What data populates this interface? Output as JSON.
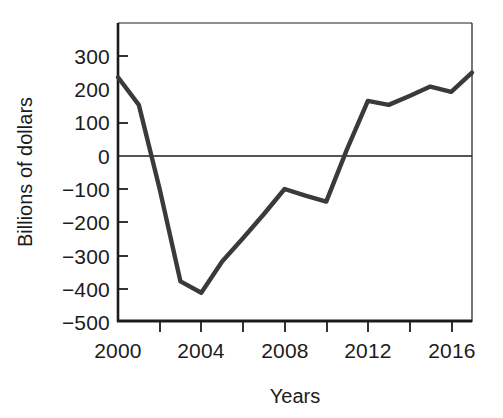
{
  "chart_data": {
    "type": "line",
    "title": "",
    "xlabel": "Years",
    "ylabel": "Billions of dollars",
    "xlim": [
      2000,
      2017
    ],
    "ylim": [
      -500,
      340
    ],
    "grid": false,
    "legend": "none",
    "zero_line": true,
    "x_ticks": [
      2000,
      2002,
      2004,
      2006,
      2008,
      2010,
      2012,
      2014,
      2016
    ],
    "x_tick_labels": [
      "2000",
      "",
      "2004",
      "",
      "2008",
      "",
      "2012",
      "",
      "2016"
    ],
    "y_ticks": [
      300,
      200,
      100,
      0,
      -100,
      -200,
      -300,
      -400,
      -500
    ],
    "y_tick_labels": [
      "300",
      "200",
      "100",
      "0",
      "−100",
      "−200",
      "−300",
      "−400",
      "−500"
    ],
    "series": [
      {
        "name": "Federal budget surplus/deficit",
        "color": "#3a3a3a",
        "x": [
          2000,
          2001,
          2002,
          2003,
          2004,
          2005,
          2006,
          2007,
          2008,
          2009,
          2010,
          2011,
          2012,
          2013,
          2014,
          2015,
          2016,
          2017
        ],
        "values": [
          236,
          153,
          -100,
          -378,
          -412,
          -318,
          -248,
          -176,
          -100,
          -120,
          -138,
          20,
          165,
          153,
          180,
          208,
          192,
          250
        ]
      }
    ]
  }
}
